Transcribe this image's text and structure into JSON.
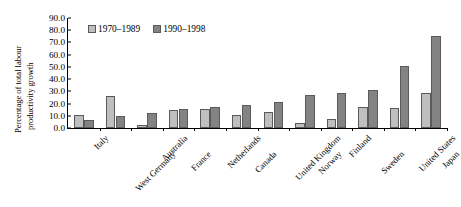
{
  "chart_data": {
    "type": "bar",
    "title": "",
    "xlabel": "",
    "ylabel": "Percentage of total labour productivity growth",
    "ylabel_lines": [
      "Percentage of total labour",
      "productivity growth"
    ],
    "ylim": [
      0,
      90
    ],
    "yticks": [
      "0.0",
      "10.0",
      "20.0",
      "30.0",
      "40.0",
      "50.0",
      "60.0",
      "70.0",
      "80.0",
      "90.0"
    ],
    "ytick_values": [
      0,
      10,
      20,
      30,
      40,
      50,
      60,
      70,
      80,
      90
    ],
    "grid": false,
    "legend_position": "top-left-inside",
    "categories": [
      "Italy",
      "West Germany",
      "Australia",
      "France",
      "Netherlands",
      "Canada",
      "United Kingdom",
      "Norway",
      "Finland",
      "Sweden",
      "United States",
      "Japan"
    ],
    "series": [
      {
        "name": "1970–1989",
        "color": "#bfbfbf",
        "values": [
          10.5,
          26.0,
          2.5,
          14.5,
          15.5,
          11.0,
          13.5,
          4.0,
          7.5,
          17.0,
          16.0,
          28.5
        ]
      },
      {
        "name": "1990–1998",
        "color": "#838383",
        "values": [
          6.5,
          10.0,
          12.5,
          15.5,
          17.5,
          18.5,
          21.0,
          27.0,
          28.5,
          31.0,
          51.0,
          75.5
        ]
      }
    ]
  },
  "legend": {
    "items": [
      {
        "label": "1970–1989",
        "series": 0
      },
      {
        "label": "1990–1998",
        "series": 1
      }
    ]
  }
}
